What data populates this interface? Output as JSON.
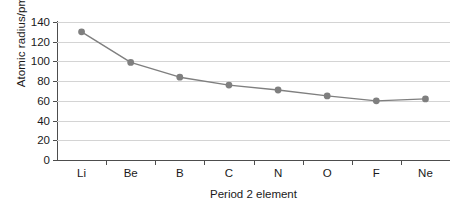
{
  "chart_data": {
    "type": "line",
    "title": "",
    "xlabel": "Period 2 element",
    "ylabel": "Atomic radius/pm",
    "categories": [
      "Li",
      "Be",
      "B",
      "C",
      "N",
      "O",
      "F",
      "Ne"
    ],
    "values": [
      130,
      99,
      84,
      76,
      71,
      65,
      60,
      62
    ],
    "ylim": [
      0,
      140
    ],
    "ytick_labels": [
      "0",
      "20",
      "40",
      "60",
      "80",
      "100",
      "120",
      "140"
    ],
    "ytick_values": [
      0,
      20,
      40,
      60,
      80,
      100,
      120,
      140
    ],
    "grid": "horizontal",
    "legend": "none",
    "series_color": "#7f7f7f",
    "marker": "circle",
    "gridline_color": "#d4d4d4",
    "axis_color": "#4d4d4d",
    "text_color": "#1a1a1a"
  }
}
